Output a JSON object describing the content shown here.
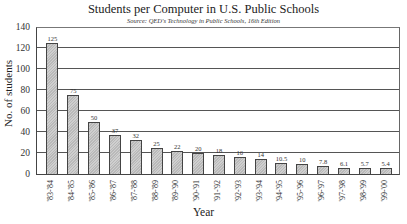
{
  "chart_data": {
    "type": "bar",
    "title": "Students per Computer in U.S. Public Schools",
    "subtitle": "Source: QED's Technology in Public Schools, 16th Edition",
    "xlabel": "Year",
    "ylabel": "No. of students",
    "ylim": [
      0,
      140
    ],
    "yticks": [
      0,
      20,
      40,
      60,
      80,
      100,
      120,
      140
    ],
    "grid": true,
    "categories": [
      "'83-'84",
      "'84-'85",
      "'85-'86",
      "'86-'87",
      "'87-'88",
      "'88-'89",
      "'89-'90",
      "'90-'91",
      "'91-'92",
      "'92-'93",
      "'93-'94",
      "'94-'95",
      "'95-'96",
      "'96-'97",
      "'97-'98",
      "'98-'99",
      "'99-'00"
    ],
    "values": [
      125,
      75,
      50,
      37,
      32,
      25,
      22,
      20,
      18,
      16,
      14,
      10.5,
      10,
      7.8,
      6.1,
      5.7,
      5.4
    ],
    "value_labels": [
      "125",
      "75",
      "50",
      "37",
      "32",
      "25",
      "22",
      "20",
      "18",
      "16",
      "14",
      "10.5",
      "10",
      "7.8",
      "6.1",
      "5.7",
      "5.4"
    ]
  }
}
